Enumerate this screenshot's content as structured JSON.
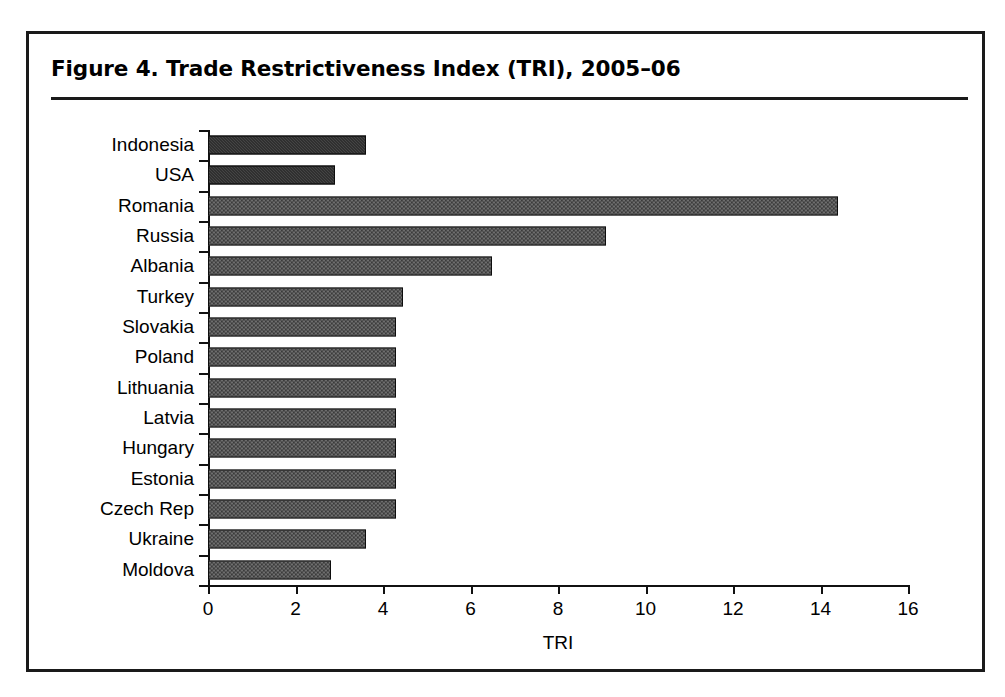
{
  "figure": {
    "caption": "Figure 4.  Trade Restrictiveness Index (TRI), 2005–06"
  },
  "chart_data": {
    "type": "bar",
    "orientation": "horizontal",
    "title": "Figure 4.  Trade Restrictiveness Index (TRI), 2005–06",
    "xlabel": "TRI",
    "ylabel": "",
    "xlim": [
      0,
      16
    ],
    "xticks": [
      0,
      2,
      4,
      6,
      8,
      10,
      12,
      14,
      16
    ],
    "xtick_labels": [
      "0",
      "2",
      "4",
      "6",
      "8",
      "10",
      "12",
      "14",
      "16"
    ],
    "grid": false,
    "legend": "none",
    "categories": [
      "Indonesia",
      "USA",
      "Romania",
      "Russia",
      "Albania",
      "Turkey",
      "Slovakia",
      "Poland",
      "Lithuania",
      "Latvia",
      "Hungary",
      "Estonia",
      "Czech Rep",
      "Ukraine",
      "Moldova"
    ],
    "values": [
      3.6,
      2.9,
      14.4,
      9.1,
      6.5,
      4.45,
      4.3,
      4.3,
      4.3,
      4.3,
      4.3,
      4.3,
      4.3,
      3.6,
      2.8
    ],
    "fills": [
      "dark",
      "dark",
      "grey",
      "grey",
      "grey",
      "grey",
      "grey",
      "grey",
      "grey",
      "grey",
      "grey",
      "grey",
      "grey",
      "grey",
      "grey"
    ],
    "colors": {
      "dark_bar": "#1c1c1c",
      "grey_bar": "#6e6e6e",
      "bar_outline": "#0d0d0d",
      "axis": "#111111",
      "frame": "#1a1a1a",
      "background": "#ffffff"
    }
  }
}
